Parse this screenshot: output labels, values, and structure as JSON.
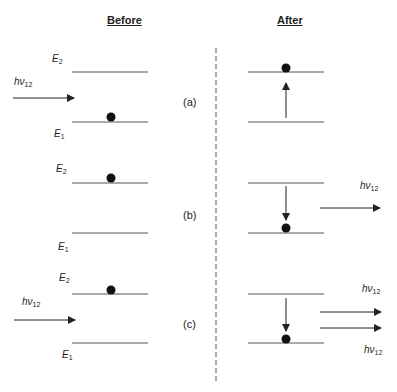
{
  "headers": {
    "before": "Before",
    "after": "After"
  },
  "energy_levels": {
    "upper": "E",
    "upper_sub": "2",
    "lower": "E",
    "lower_sub": "1"
  },
  "photon": {
    "symbol": "hν",
    "sub": "12"
  },
  "cases": [
    {
      "label": "(a)",
      "process": "absorption"
    },
    {
      "label": "(b)",
      "process": "spontaneous-emission"
    },
    {
      "label": "(c)",
      "process": "stimulated-emission"
    }
  ],
  "colors": {
    "line": "#555555",
    "dot": "#111111",
    "arrow": "#222222"
  }
}
